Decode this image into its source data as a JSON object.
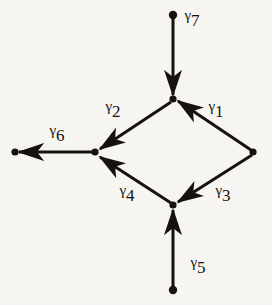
{
  "figure": {
    "type": "directed-graph-diagram",
    "background_color": "#f7f5f1",
    "ink_color": "#15120f",
    "width": 272,
    "height": 305
  },
  "nodes": [
    {
      "id": "n-top-terminal",
      "name": "top-terminal-vertex",
      "x": 173,
      "y": 15,
      "radius": 4.0,
      "filled": true
    },
    {
      "id": "n-top",
      "name": "top-vertex",
      "x": 173,
      "y": 99,
      "radius": 3.5,
      "filled": true
    },
    {
      "id": "n-right",
      "name": "right-vertex",
      "x": 253,
      "y": 152,
      "radius": 3.5,
      "filled": true
    },
    {
      "id": "n-left",
      "name": "left-vertex",
      "x": 95,
      "y": 152,
      "radius": 3.5,
      "filled": true
    },
    {
      "id": "n-bottom",
      "name": "bottom-vertex",
      "x": 173,
      "y": 205,
      "radius": 3.5,
      "filled": true
    },
    {
      "id": "n-left-terminal",
      "name": "left-terminal-vertex",
      "x": 15,
      "y": 152,
      "radius": 3.5,
      "filled": true
    },
    {
      "id": "n-bottom-terminal",
      "name": "bottom-terminal-vertex",
      "x": 173,
      "y": 290,
      "radius": 4.0,
      "filled": true
    }
  ],
  "edges": [
    {
      "id": "g1",
      "label": "γ",
      "subscript": "1",
      "from": "n-right",
      "to": "n-top",
      "label_x": 216,
      "label_y": 107
    },
    {
      "id": "g2",
      "label": "γ",
      "subscript": "2",
      "from": "n-top",
      "to": "n-left",
      "label_x": 113,
      "label_y": 107
    },
    {
      "id": "g3",
      "label": "γ",
      "subscript": "3",
      "from": "n-right",
      "to": "n-bottom",
      "label_x": 223,
      "label_y": 191
    },
    {
      "id": "g4",
      "label": "γ",
      "subscript": "4",
      "from": "n-bottom",
      "to": "n-left",
      "label_x": 127,
      "label_y": 191
    },
    {
      "id": "g5",
      "label": "γ",
      "subscript": "5",
      "from": "n-bottom-terminal",
      "to": "n-bottom",
      "label_x": 198,
      "label_y": 263
    },
    {
      "id": "g6",
      "label": "γ",
      "subscript": "6",
      "from": "n-left",
      "to": "n-left-terminal",
      "label_x": 57,
      "label_y": 131
    },
    {
      "id": "g7",
      "label": "γ",
      "subscript": "7",
      "from": "n-top-terminal",
      "to": "n-top",
      "label_x": 192,
      "label_y": 16
    }
  ]
}
